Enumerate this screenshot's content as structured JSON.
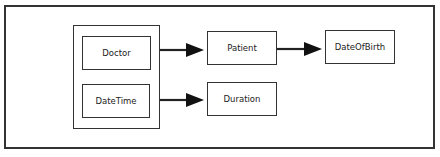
{
  "diagram": {
    "group_label": "",
    "nodes": [
      {
        "id": "doctor",
        "label": "Doctor"
      },
      {
        "id": "datetime",
        "label": "DateTime"
      },
      {
        "id": "patient",
        "label": "Patient"
      },
      {
        "id": "duration",
        "label": "Duration"
      },
      {
        "id": "dateofbirth",
        "label": "DateOfBirth"
      }
    ],
    "edges": [
      {
        "from": "doctor",
        "to": "patient"
      },
      {
        "from": "patient",
        "to": "dateofbirth"
      },
      {
        "from": "datetime",
        "to": "duration"
      }
    ],
    "colors": {
      "stroke": "#333333",
      "background": "#ffffff"
    }
  }
}
